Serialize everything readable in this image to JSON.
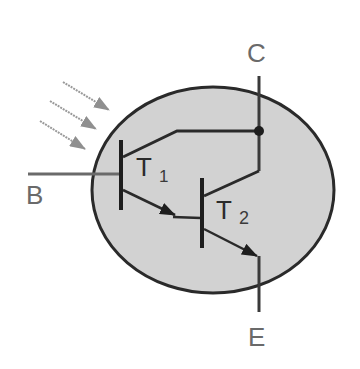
{
  "diagram": {
    "type": "photodarlington-schematic",
    "colors": {
      "background": "#ffffff",
      "package_fill": "#d2d2d2",
      "package_stroke": "#2a2a2a",
      "wire": "#2a2a2a",
      "lead": "#6a6a6a",
      "light_ray": "#9a9a9a",
      "label": "#6a6a6a"
    },
    "terminals": {
      "base": "B",
      "collector": "C",
      "emitter": "E"
    },
    "transistors": [
      {
        "name": "T",
        "subscript": "1"
      },
      {
        "name": "T",
        "subscript": "2"
      }
    ],
    "light_rays": {
      "count": 3,
      "icon": "incident-light-arrows"
    }
  }
}
